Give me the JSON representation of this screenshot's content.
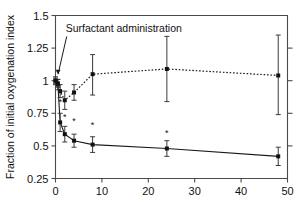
{
  "chart_data": {
    "type": "line",
    "title": "",
    "xlabel": "",
    "ylabel": "Fraction of initial oxygenation index",
    "xlim": [
      0,
      50
    ],
    "ylim": [
      0.25,
      1.5
    ],
    "xticks": [
      0,
      10,
      20,
      30,
      40,
      50
    ],
    "xticklabels": [
      "0",
      "10",
      "20",
      "30",
      "40",
      "50"
    ],
    "yticks": [
      0.25,
      0.5,
      0.75,
      1,
      1.25,
      1.5
    ],
    "yticklabels": [
      "0.25",
      "0.5",
      "0.75",
      "1",
      "1.25",
      "1.5"
    ],
    "grid": false,
    "legend": "none",
    "annotations": [
      {
        "text": "Surfactant administration",
        "x": 2.2,
        "y": 1.37,
        "leader_to_x": 0.55,
        "leader_to_y": 1.05
      }
    ],
    "series": [
      {
        "name": "upper-dotted",
        "style": "dotted",
        "marker": "square",
        "x": [
          0,
          0.5,
          1,
          2,
          4,
          8,
          24,
          48
        ],
        "values": [
          1.0,
          0.97,
          0.92,
          0.85,
          0.91,
          1.05,
          1.09,
          1.04
        ],
        "err_low": [
          0.03,
          0.04,
          0.05,
          0.07,
          0.06,
          0.16,
          0.25,
          0.3
        ],
        "err_high": [
          0.03,
          0.04,
          0.05,
          0.07,
          0.06,
          0.15,
          0.25,
          0.31
        ],
        "significance": []
      },
      {
        "name": "lower-solid",
        "style": "solid",
        "marker": "square",
        "x": [
          0,
          0.5,
          1,
          2,
          4,
          8,
          24,
          48
        ],
        "values": [
          1.0,
          0.98,
          0.68,
          0.59,
          0.54,
          0.51,
          0.48,
          0.42
        ],
        "err_low": [
          0.02,
          0.03,
          0.07,
          0.06,
          0.05,
          0.06,
          0.06,
          0.07
        ],
        "err_high": [
          0.02,
          0.03,
          0.07,
          0.06,
          0.05,
          0.06,
          0.06,
          0.07
        ],
        "significance": [
          {
            "x": 1,
            "y": 0.81
          },
          {
            "x": 2,
            "y": 0.7
          },
          {
            "x": 4,
            "y": 0.665
          },
          {
            "x": 8,
            "y": 0.635
          },
          {
            "x": 24,
            "y": 0.575
          }
        ]
      }
    ]
  }
}
